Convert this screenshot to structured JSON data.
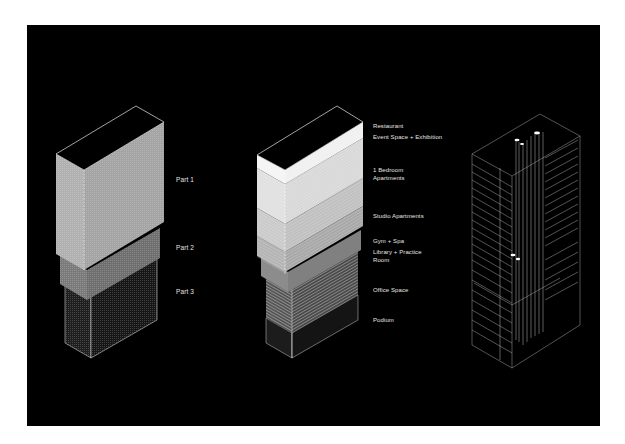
{
  "figure": {
    "background": "#000000",
    "page_background": "#ffffff"
  },
  "diagram_1": {
    "title": "Massing parts",
    "labels": [
      {
        "text": "Part 1",
        "x": 176,
        "y": 176
      },
      {
        "text": "Part 2",
        "x": 176,
        "y": 244
      },
      {
        "text": "Part 3",
        "x": 176,
        "y": 288
      }
    ],
    "colors": {
      "part1": "#a9a9a9",
      "part2": "#767676",
      "part3": "#1c1c1c",
      "edge": "#d8d8d8"
    }
  },
  "diagram_2": {
    "title": "Program stack",
    "labels": [
      {
        "text": "Restaurant",
        "x": 373,
        "y": 122
      },
      {
        "text": "Event Space + Exhibition",
        "x": 373,
        "y": 133
      },
      {
        "text": "1 Bedroom",
        "x": 373,
        "y": 166
      },
      {
        "text": "Apartments",
        "x": 373,
        "y": 174
      },
      {
        "text": "Studio Apartments",
        "x": 373,
        "y": 212
      },
      {
        "text": "Gym + Spa",
        "x": 373,
        "y": 237
      },
      {
        "text": "Library + Practice",
        "x": 373,
        "y": 248
      },
      {
        "text": "Room",
        "x": 373,
        "y": 256
      },
      {
        "text": "Office Space",
        "x": 373,
        "y": 286
      },
      {
        "text": "Podium",
        "x": 373,
        "y": 316
      }
    ],
    "colors": {
      "restaurant": "#f2f2f2",
      "event": "#ececec",
      "bedroom": "#dcdcdc",
      "studio": "#c6c6c6",
      "gym": "#a8a8a8",
      "library": "#8a8a8a",
      "office": "#4a4a4a",
      "podium": "#202020"
    }
  },
  "diagram_3": {
    "title": "Structural wireframe",
    "colors": {
      "line": "#bdbdbd",
      "highlight": "#ffffff"
    }
  }
}
